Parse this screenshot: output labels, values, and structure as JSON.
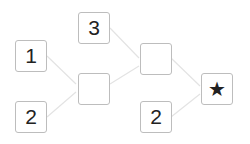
{
  "diagram": {
    "inputs_left": [
      {
        "id": "a",
        "value": "1"
      },
      {
        "id": "b",
        "value": "2"
      }
    ],
    "top_input": {
      "id": "c",
      "value": "3"
    },
    "middle_blank": {
      "id": "m1",
      "value": ""
    },
    "second_blank": {
      "id": "m2",
      "value": ""
    },
    "bottom_input": {
      "id": "d",
      "value": "2"
    },
    "result": {
      "id": "r",
      "symbol": "★"
    },
    "edge_color": "#e6e6e6",
    "box_border_color": "#bdbdbd"
  }
}
